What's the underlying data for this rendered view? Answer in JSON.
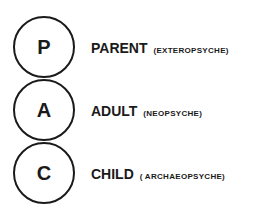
{
  "diagram": {
    "type": "ego-states",
    "states": [
      {
        "letter": "P",
        "name": "PARENT",
        "subtitle": "(EXTEROPSYCHE)"
      },
      {
        "letter": "A",
        "name": "ADULT",
        "subtitle": "(NEOPSYCHE)"
      },
      {
        "letter": "C",
        "name": "CHILD",
        "subtitle": "( ARCHAEOPSYCHE)"
      }
    ]
  }
}
